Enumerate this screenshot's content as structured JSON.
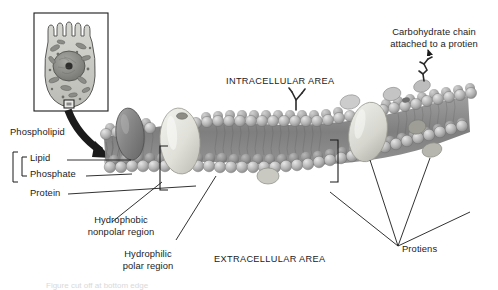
{
  "figure": {
    "domain_note": "biology textbook illustration, grayscale"
  },
  "regions": {
    "intracellular": "INTRACELLULAR AREA",
    "extracellular": "EXTRACELLULAR AREA"
  },
  "labels": {
    "phospholipid": "Phospholipid",
    "lipid": "Lipid",
    "phosphate": "Phosphate",
    "protein": "Protein",
    "hydrophobic_line1": "Hydrophobic",
    "hydrophobic_line2": "nonpolar region",
    "hydrophilic_line1": "Hydrophilic",
    "hydrophilic_line2": "polar region",
    "carbohydrate_line1": "Carbohydrate chain",
    "carbohydrate_line2": "attached to a protien",
    "proteins": "Protiens"
  },
  "inset": {
    "name": "epithelial-cell-with-microvilli",
    "callout_box": "membrane-sample-box"
  },
  "colors": {
    "ink": "#1b1b1b",
    "leader": "#2a2a2a",
    "membrane_mid": "#8f8f8f",
    "head_light": "#cfcfcf",
    "head_dark": "#8a8a8a",
    "protein_dark": "#7c7c7c",
    "protein_light": "#d8d8d2",
    "background": "#ffffff"
  },
  "footer_cut": "Figure cut off at bottom edge"
}
